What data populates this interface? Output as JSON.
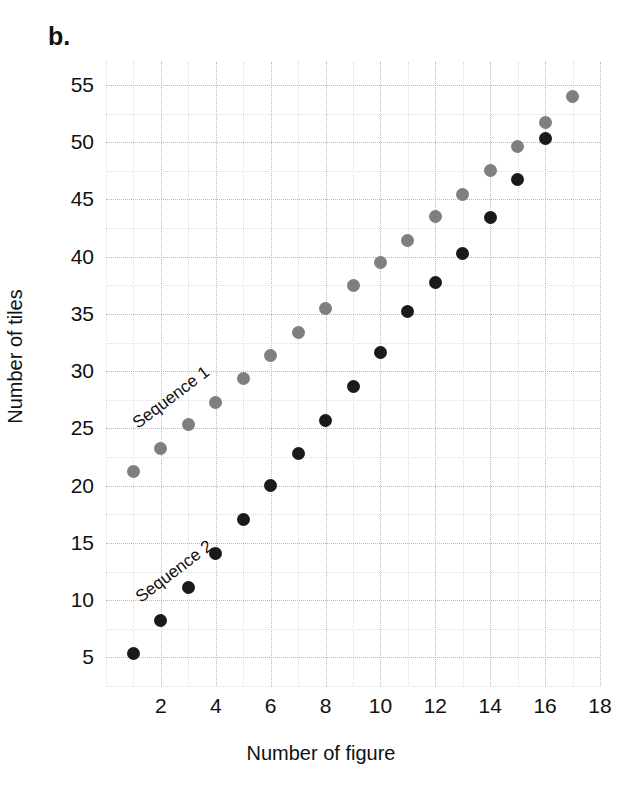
{
  "panel": {
    "label": "b."
  },
  "chart_data": {
    "type": "scatter",
    "title": "",
    "xlabel": "Number of figure",
    "ylabel": "Number of tiles",
    "xlim": [
      0,
      18
    ],
    "ylim": [
      2.5,
      57
    ],
    "grid": true,
    "x_ticks": [
      2,
      4,
      6,
      8,
      10,
      12,
      14,
      16,
      18
    ],
    "y_ticks": [
      5,
      10,
      15,
      20,
      25,
      30,
      35,
      40,
      45,
      50,
      55
    ],
    "x_minor_step": 1,
    "y_minor_step": 2.5,
    "legend_position": "inline-annotation",
    "series": [
      {
        "name": "Sequence 1",
        "color": "#7f7f7f",
        "annotation": "Sequence 1",
        "x": [
          1,
          2,
          3,
          4,
          5,
          6,
          7,
          8,
          9,
          10,
          11,
          12,
          13,
          14,
          15,
          16,
          17
        ],
        "values": [
          21.2,
          23.2,
          25.3,
          27.3,
          29.4,
          31.4,
          33.4,
          35.5,
          37.5,
          39.5,
          41.4,
          43.5,
          45.4,
          47.5,
          49.6,
          51.7,
          54.0
        ]
      },
      {
        "name": "Sequence 2",
        "color": "#1a1a1a",
        "annotation": "Sequence 2",
        "x": [
          1,
          2,
          3,
          4,
          5,
          6,
          7,
          8,
          9,
          10,
          11,
          12,
          13,
          14,
          15,
          16
        ],
        "values": [
          5.3,
          8.2,
          11.1,
          14.1,
          17.0,
          20.0,
          22.8,
          25.7,
          28.7,
          31.6,
          35.2,
          37.7,
          40.3,
          43.4,
          46.7,
          50.3
        ]
      }
    ]
  }
}
